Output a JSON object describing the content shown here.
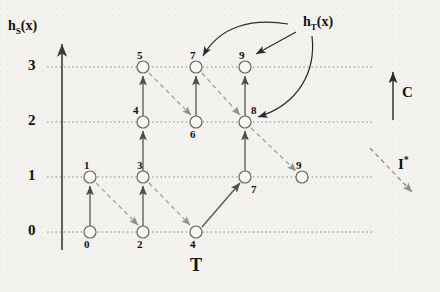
{
  "figure": {
    "yaxis_label": "h_S(x)",
    "yaxis_label_base": "h",
    "yaxis_label_sub": "S",
    "yaxis_label_tail": "(x)",
    "xaxis_label": "T",
    "annotation_label_base": "h",
    "annotation_label_sub": "T",
    "annotation_label_tail": "(x)",
    "annotation_label_full": "h_T(x)"
  },
  "yticks": [
    {
      "value": "3",
      "y": 67
    },
    {
      "value": "2",
      "y": 122
    },
    {
      "value": "1",
      "y": 177
    },
    {
      "value": "0",
      "y": 232
    }
  ],
  "nodes": [
    {
      "id": "n0",
      "label": "0",
      "x": 90,
      "y": 232,
      "label_pos": "below"
    },
    {
      "id": "n1",
      "label": "1",
      "x": 90,
      "y": 177,
      "label_pos": "above"
    },
    {
      "id": "n2",
      "label": "2",
      "x": 143,
      "y": 232,
      "label_pos": "below"
    },
    {
      "id": "n3",
      "label": "3",
      "x": 143,
      "y": 177,
      "label_pos": "above"
    },
    {
      "id": "n4",
      "label": "4",
      "x": 143,
      "y": 122,
      "label_pos": "above"
    },
    {
      "id": "n5",
      "label": "5",
      "x": 143,
      "y": 67,
      "label_pos": "above"
    },
    {
      "id": "n4b",
      "label": "4",
      "x": 196,
      "y": 232,
      "label_pos": "below"
    },
    {
      "id": "n6",
      "label": "6",
      "x": 196,
      "y": 122,
      "label_pos": "below"
    },
    {
      "id": "n7",
      "label": "7",
      "x": 196,
      "y": 67,
      "label_pos": "above"
    },
    {
      "id": "n7b",
      "label": "7",
      "x": 245,
      "y": 177,
      "label_pos": "belowright"
    },
    {
      "id": "n8",
      "label": "8",
      "x": 245,
      "y": 122,
      "label_pos": "aboveright"
    },
    {
      "id": "n9",
      "label": "9",
      "x": 245,
      "y": 67,
      "label_pos": "above"
    },
    {
      "id": "n9b",
      "label": "9",
      "x": 302,
      "y": 177,
      "label_pos": "above"
    }
  ],
  "edges_solid": [
    {
      "from": "n0",
      "to": "n1"
    },
    {
      "from": "n2",
      "to": "n3"
    },
    {
      "from": "n3",
      "to": "n4"
    },
    {
      "from": "n4",
      "to": "n5"
    },
    {
      "from": "n6",
      "to": "n7"
    },
    {
      "from": "n4b",
      "to": "n7b"
    },
    {
      "from": "n7b",
      "to": "n8"
    },
    {
      "from": "n8",
      "to": "n9"
    }
  ],
  "edges_dashed": [
    {
      "from": "n1",
      "to": "n2"
    },
    {
      "from": "n3",
      "to": "n4b"
    },
    {
      "from": "n5",
      "to": "n6"
    },
    {
      "from": "n7",
      "to": "n8"
    },
    {
      "from": "n8",
      "to": "n9b"
    }
  ],
  "annotation_arrows": [
    {
      "name": "arrow-to-node-7",
      "target": "n7",
      "style": "curved"
    },
    {
      "name": "arrow-to-node-9",
      "target": "n9",
      "style": "straight"
    },
    {
      "name": "arrow-to-node-8",
      "target": "n8",
      "style": "curved"
    }
  ],
  "legend": [
    {
      "name": "legend-c",
      "label": "C",
      "style": "solid-up-arrow"
    },
    {
      "name": "legend-i",
      "label": "I",
      "label_sup": "*",
      "style": "dashed-diagonal-arrow"
    }
  ],
  "colors": {
    "background": "#f4f2ee",
    "ink": "#1a1a1a",
    "gridline": "#8d8d8d",
    "solid_edge": "#555555",
    "dashed_edge": "#9a9a9a",
    "node_stroke": "#666666",
    "node_fill": "#f7f6f3"
  }
}
